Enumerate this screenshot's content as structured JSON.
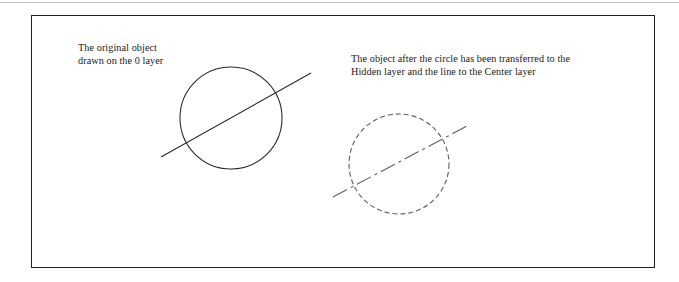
{
  "page": {
    "background_color": "#ffffff",
    "scan_rule_color": "#b9b9b9"
  },
  "frame": {
    "border_color": "#202020",
    "x": 31,
    "y": 15,
    "width": 624,
    "height": 253
  },
  "captions": {
    "left": "The original object\ndrawn on the 0 layer",
    "right": "The object after the circle has been transferred to the\nHidden layer and the line to the Center layer"
  },
  "drawings": {
    "original": {
      "label": "original-object-0-layer",
      "circle": {
        "cx": 231,
        "cy": 118,
        "r": 51,
        "stroke": "#2b2b2b",
        "stroke_width": 1.1,
        "linetype": "continuous"
      },
      "line": {
        "x1": 161,
        "y1": 157,
        "x2": 311,
        "y2": 73,
        "stroke": "#2b2b2b",
        "stroke_width": 1.1,
        "linetype": "continuous"
      }
    },
    "transferred": {
      "label": "transferred-object-hidden-center-layers",
      "circle": {
        "cx": 399,
        "cy": 164,
        "r": 50,
        "stroke": "#5e5e5e",
        "stroke_width": 1.1,
        "linetype": "hidden",
        "dash_pattern": "5,3"
      },
      "line": {
        "x1": 333,
        "y1": 197,
        "x2": 467,
        "y2": 126,
        "stroke": "#5e5e5e",
        "stroke_width": 1.1,
        "linetype": "center",
        "dash_pattern": "16,4,3,4"
      }
    }
  },
  "layer_names": {
    "zero": "0",
    "hidden": "Hidden",
    "center": "Center"
  }
}
